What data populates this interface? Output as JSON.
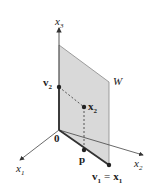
{
  "diagram": {
    "type": "3d-subspace-projection",
    "axes": {
      "x1": {
        "label": "x",
        "sub": "1"
      },
      "x2": {
        "label": "x",
        "sub": "2"
      },
      "x3": {
        "label": "x",
        "sub": "3"
      }
    },
    "origin_label": "0",
    "plane_label": "W",
    "points": {
      "v2": {
        "label": "v",
        "sub": "2"
      },
      "x2": {
        "label": "x",
        "sub": "2"
      },
      "p": {
        "label": "p"
      },
      "v1": {
        "label": "v",
        "sub": "1",
        "eq": "=",
        "label2": "x",
        "sub2": "1"
      }
    },
    "colors": {
      "plane_fill": "#d9d9d9",
      "plane_edge": "#777777",
      "axis": "#333333",
      "points": "#222222"
    }
  }
}
